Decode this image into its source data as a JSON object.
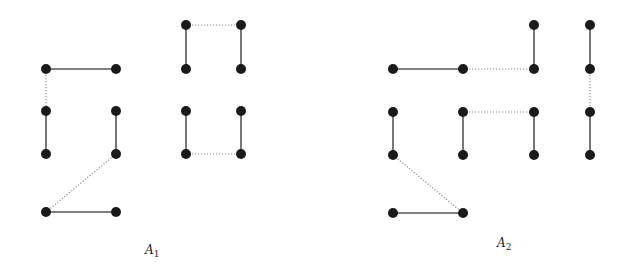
{
  "figure": {
    "graphs": [
      {
        "id": "A1",
        "label": "A",
        "subscript": "1",
        "label_pos": [
          145,
          243
        ],
        "nodes": [
          [
            46,
            69
          ],
          [
            116,
            69
          ],
          [
            46,
            111
          ],
          [
            116,
            111
          ],
          [
            46,
            154
          ],
          [
            116,
            154
          ],
          [
            46,
            212
          ],
          [
            116,
            212
          ],
          [
            186,
            25
          ],
          [
            241,
            25
          ],
          [
            186,
            69
          ],
          [
            241,
            69
          ],
          [
            186,
            111
          ],
          [
            241,
            111
          ],
          [
            186,
            154
          ],
          [
            241,
            154
          ]
        ],
        "edges": [
          {
            "from": 0,
            "to": 1,
            "style": "solid"
          },
          {
            "from": 0,
            "to": 2,
            "style": "dotted"
          },
          {
            "from": 2,
            "to": 4,
            "style": "solid"
          },
          {
            "from": 3,
            "to": 5,
            "style": "solid"
          },
          {
            "from": 5,
            "to": 6,
            "style": "dotted"
          },
          {
            "from": 6,
            "to": 7,
            "style": "solid"
          },
          {
            "from": 8,
            "to": 9,
            "style": "dotted"
          },
          {
            "from": 8,
            "to": 10,
            "style": "solid"
          },
          {
            "from": 9,
            "to": 11,
            "style": "solid"
          },
          {
            "from": 12,
            "to": 14,
            "style": "solid"
          },
          {
            "from": 13,
            "to": 15,
            "style": "solid"
          },
          {
            "from": 14,
            "to": 15,
            "style": "dotted"
          }
        ]
      },
      {
        "id": "A2",
        "label": "A",
        "subscript": "2",
        "label_pos": [
          497,
          236
        ],
        "nodes": [
          [
            534,
            25
          ],
          [
            590,
            25
          ],
          [
            393,
            69
          ],
          [
            463,
            69
          ],
          [
            534,
            69
          ],
          [
            590,
            69
          ],
          [
            393,
            112
          ],
          [
            463,
            112
          ],
          [
            534,
            112
          ],
          [
            590,
            112
          ],
          [
            393,
            155
          ],
          [
            463,
            155
          ],
          [
            534,
            155
          ],
          [
            590,
            155
          ],
          [
            393,
            213
          ],
          [
            463,
            213
          ]
        ],
        "edges": [
          {
            "from": 2,
            "to": 3,
            "style": "solid"
          },
          {
            "from": 3,
            "to": 4,
            "style": "dotted"
          },
          {
            "from": 0,
            "to": 4,
            "style": "solid"
          },
          {
            "from": 1,
            "to": 5,
            "style": "solid"
          },
          {
            "from": 5,
            "to": 9,
            "style": "dotted"
          },
          {
            "from": 9,
            "to": 13,
            "style": "solid"
          },
          {
            "from": 7,
            "to": 8,
            "style": "dotted"
          },
          {
            "from": 7,
            "to": 11,
            "style": "solid"
          },
          {
            "from": 8,
            "to": 12,
            "style": "solid"
          },
          {
            "from": 6,
            "to": 10,
            "style": "solid"
          },
          {
            "from": 10,
            "to": 15,
            "style": "dotted"
          },
          {
            "from": 14,
            "to": 15,
            "style": "solid"
          }
        ]
      }
    ],
    "node_radius": 5,
    "colors": {
      "node": "#1a1a1a",
      "solid_edge": "#555555",
      "dotted_edge": "#8a8a8a",
      "background": "#ffffff"
    }
  }
}
